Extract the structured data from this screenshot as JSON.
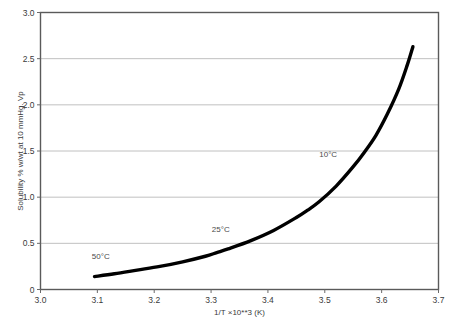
{
  "chart_data": {
    "type": "line",
    "title": "",
    "subtitle": "",
    "xlabel": "1/T ×10**3 (K)",
    "ylabel": "Solubility % w/wt at 10 mmHg. Vp",
    "xlim": [
      3.0,
      3.7
    ],
    "ylim": [
      0,
      3.0
    ],
    "grid": "horizontal",
    "legend": "none",
    "xticks": [
      "3.0",
      "3.1",
      "3.2",
      "3.3",
      "3.4",
      "3.5",
      "3.6",
      "3.7"
    ],
    "xtick_values": [
      3.0,
      3.1,
      3.2,
      3.3,
      3.4,
      3.5,
      3.6,
      3.7
    ],
    "yticks": [
      "0",
      "0.5",
      "1.0",
      "1.5",
      "2.0",
      "2.5",
      "3.0"
    ],
    "ytick_values": [
      0,
      0.5,
      1.0,
      1.5,
      2.0,
      2.5,
      3.0
    ],
    "series": [
      {
        "name": "Solubility vs 1/T",
        "color": "#000000",
        "x": [
          3.095,
          3.13,
          3.17,
          3.21,
          3.25,
          3.29,
          3.31,
          3.33,
          3.37,
          3.41,
          3.45,
          3.47,
          3.49,
          3.52,
          3.55,
          3.57,
          3.59,
          3.61,
          3.63,
          3.645,
          3.655
        ],
        "y": [
          0.14,
          0.17,
          0.21,
          0.25,
          0.3,
          0.36,
          0.4,
          0.44,
          0.53,
          0.64,
          0.78,
          0.86,
          0.95,
          1.12,
          1.33,
          1.49,
          1.67,
          1.9,
          2.17,
          2.43,
          2.63
        ]
      }
    ],
    "annotations": [
      {
        "label": "50°C",
        "x": 3.106,
        "y": 0.33
      },
      {
        "label": "25°C",
        "x": 3.317,
        "y": 0.62
      },
      {
        "label": "10°C",
        "x": 3.506,
        "y": 1.43
      }
    ]
  }
}
